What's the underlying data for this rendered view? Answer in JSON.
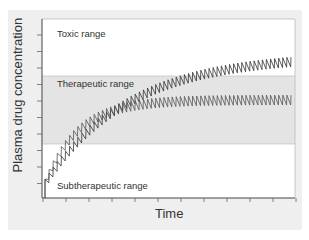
{
  "chart_data": {
    "type": "line",
    "title": "",
    "xlabel": "Time",
    "ylabel": "Plasma drug concentration",
    "grid": false,
    "regions": [
      {
        "name": "Toxic range",
        "y_from_px": 19,
        "y_to_px": 76,
        "color": "#ffffff"
      },
      {
        "name": "Therapeutic range",
        "y_from_px": 76,
        "y_to_px": 144,
        "color": "#e6e6e6"
      },
      {
        "name": "Subtherapeutic range",
        "y_from_px": 144,
        "y_to_px": 198,
        "color": "#ffffff"
      }
    ],
    "series": [
      {
        "name": "Higher dosing (accumulates toward toxic)",
        "start_level": 0.05,
        "end_level": 0.77,
        "oscillation": "sawtooth, repeated dosing",
        "color": "#333333"
      },
      {
        "name": "Lower dosing (steady state in therapeutic range)",
        "start_level": 0.05,
        "end_level": 0.52,
        "oscillation": "sawtooth, repeated dosing",
        "color": "#555555"
      }
    ],
    "x_ticks": 12,
    "y_ticks": 10
  },
  "labels": {
    "ylabel": "Plasma drug concentration",
    "xlabel": "Time",
    "toxic": "Toxic range",
    "therapeutic": "Therapeutic range",
    "subtherapeutic": "Subtherapeutic range"
  }
}
